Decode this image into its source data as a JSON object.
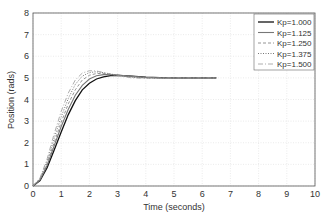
{
  "chart_data": {
    "type": "line",
    "title": "",
    "xlabel": "Time (seconds)",
    "ylabel": "Position (rads)",
    "xlim": [
      0,
      10
    ],
    "ylim": [
      0,
      8
    ],
    "xticks": [
      "0",
      "1",
      "2",
      "3",
      "4",
      "5",
      "6",
      "7",
      "8",
      "9",
      "10"
    ],
    "yticks": [
      "0",
      "1",
      "2",
      "3",
      "4",
      "5",
      "6",
      "7",
      "8"
    ],
    "grid": true,
    "legend_position": "upper right",
    "x": [
      0,
      0.25,
      0.5,
      0.75,
      1.0,
      1.25,
      1.5,
      1.75,
      2.0,
      2.25,
      2.5,
      2.75,
      3.0,
      3.5,
      4.0,
      4.5,
      5.0,
      5.5,
      6.0,
      6.5
    ],
    "series": [
      {
        "name": "Kp=1.000",
        "style": "solid-thick",
        "values": [
          0,
          0.25,
          0.85,
          1.65,
          2.5,
          3.3,
          3.95,
          4.45,
          4.75,
          4.95,
          5.05,
          5.1,
          5.12,
          5.08,
          5.03,
          5.01,
          5.0,
          5.0,
          5.0,
          5.0
        ]
      },
      {
        "name": "Kp=1.125",
        "style": "solid-gray",
        "values": [
          0,
          0.28,
          0.95,
          1.85,
          2.75,
          3.55,
          4.2,
          4.65,
          4.95,
          5.1,
          5.15,
          5.15,
          5.13,
          5.07,
          5.02,
          5.0,
          5.0,
          5.0,
          5.0,
          5.0
        ]
      },
      {
        "name": "Kp=1.250",
        "style": "dashed",
        "values": [
          0,
          0.31,
          1.05,
          2.0,
          2.95,
          3.8,
          4.45,
          4.9,
          5.12,
          5.2,
          5.2,
          5.17,
          5.13,
          5.05,
          5.01,
          4.99,
          5.0,
          5.0,
          5.0,
          5.0
        ]
      },
      {
        "name": "Kp=1.375",
        "style": "dotted",
        "values": [
          0,
          0.34,
          1.15,
          2.2,
          3.2,
          4.05,
          4.7,
          5.08,
          5.25,
          5.28,
          5.24,
          5.18,
          5.12,
          5.03,
          4.99,
          4.99,
          5.0,
          5.0,
          5.0,
          5.0
        ]
      },
      {
        "name": "Kp=1.500",
        "style": "dashdot",
        "values": [
          0,
          0.37,
          1.25,
          2.4,
          3.45,
          4.3,
          4.9,
          5.22,
          5.33,
          5.32,
          5.25,
          5.17,
          5.1,
          5.0,
          4.98,
          4.99,
          5.0,
          5.0,
          5.0,
          5.0
        ]
      }
    ]
  }
}
